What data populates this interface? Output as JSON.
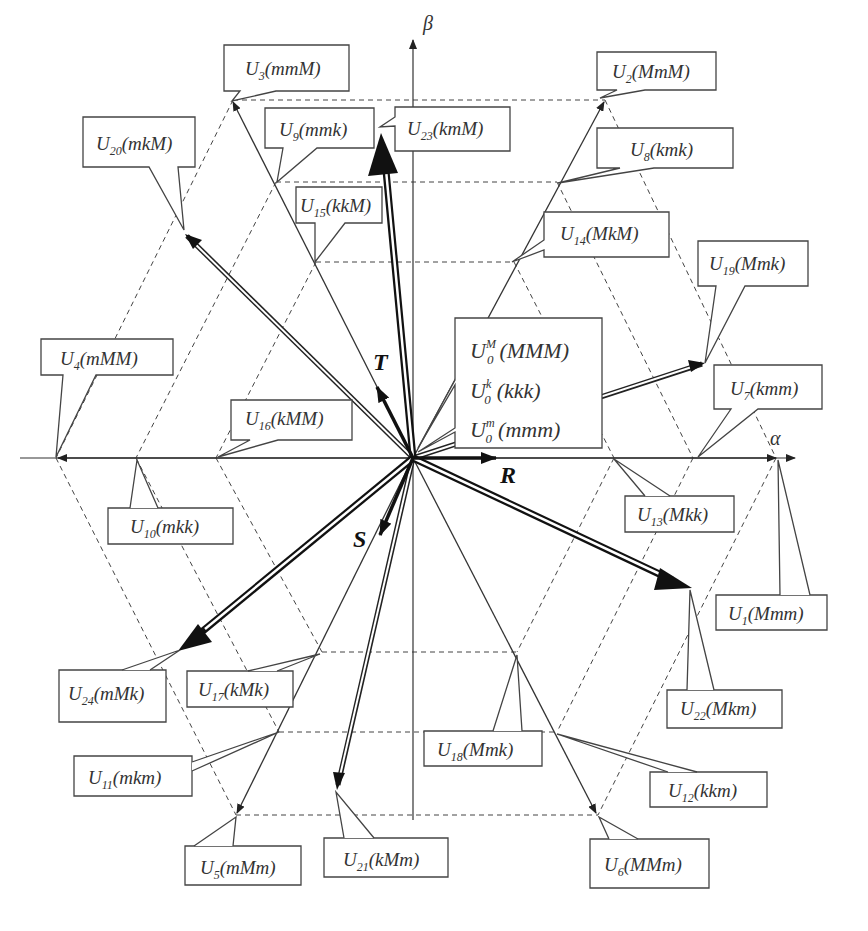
{
  "axes": {
    "alpha": "α",
    "beta": "β"
  },
  "control_vectors": [
    "R",
    "S",
    "T"
  ],
  "zero_vectors": [
    {
      "base": "U",
      "sub": "0",
      "sup": "M",
      "state": "(MMM)"
    },
    {
      "base": "U",
      "sub": "0",
      "sup": "k",
      "state": "(kkk)"
    },
    {
      "base": "U",
      "sub": "0",
      "sup": "m",
      "state": "(mmm)"
    }
  ],
  "vectors": [
    {
      "id": "U1",
      "base": "U",
      "sub": "1",
      "state": "(Mmm)"
    },
    {
      "id": "U2",
      "base": "U",
      "sub": "2",
      "state": "(MmM)"
    },
    {
      "id": "U3",
      "base": "U",
      "sub": "3",
      "state": "(mmM)"
    },
    {
      "id": "U4",
      "base": "U",
      "sub": "4",
      "state": "(mMM)"
    },
    {
      "id": "U5",
      "base": "U",
      "sub": "5",
      "state": "(mMm)"
    },
    {
      "id": "U6",
      "base": "U",
      "sub": "6",
      "state": "(MMm)"
    },
    {
      "id": "U7",
      "base": "U",
      "sub": "7",
      "state": "(kmm)"
    },
    {
      "id": "U8",
      "base": "U",
      "sub": "8",
      "state": "(kmk)"
    },
    {
      "id": "U9",
      "base": "U",
      "sub": "9",
      "state": "(mmk)"
    },
    {
      "id": "U10",
      "base": "U",
      "sub": "10",
      "state": "(mkk)"
    },
    {
      "id": "U11",
      "base": "U",
      "sub": "11",
      "state": "(mkm)"
    },
    {
      "id": "U12",
      "base": "U",
      "sub": "12",
      "state": "(kkm)"
    },
    {
      "id": "U13",
      "base": "U",
      "sub": "13",
      "state": "(Mkk)"
    },
    {
      "id": "U14",
      "base": "U",
      "sub": "14",
      "state": "(MkM)"
    },
    {
      "id": "U15",
      "base": "U",
      "sub": "15",
      "state": "(kkM)"
    },
    {
      "id": "U16",
      "base": "U",
      "sub": "16",
      "state": "(kMM)"
    },
    {
      "id": "U17",
      "base": "U",
      "sub": "17",
      "state": "(kMk)"
    },
    {
      "id": "U18",
      "base": "U",
      "sub": "18",
      "state": "(Mmk)"
    },
    {
      "id": "U19",
      "base": "U",
      "sub": "19",
      "state": "(Mmk)"
    },
    {
      "id": "U20",
      "base": "U",
      "sub": "20",
      "state": "(mkM)"
    },
    {
      "id": "U21",
      "base": "U",
      "sub": "21",
      "state": "(kMm)"
    },
    {
      "id": "U22",
      "base": "U",
      "sub": "22",
      "state": "(Mkm)"
    },
    {
      "id": "U23",
      "base": "U",
      "sub": "23",
      "state": "(kmM)"
    },
    {
      "id": "U24",
      "base": "U",
      "sub": "24",
      "state": "(mMk)"
    }
  ]
}
